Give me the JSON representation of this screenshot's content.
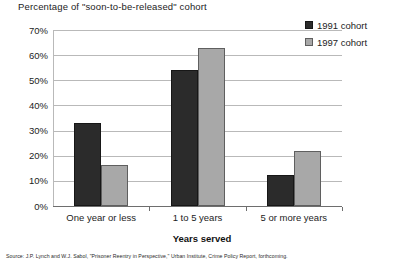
{
  "chart_data": {
    "type": "bar",
    "title": "Percentage of \"soon-to-be-released\" cohort",
    "xlabel": "Years served",
    "ylabel": "",
    "categories": [
      "One year or less",
      "1 to 5 years",
      "5 or more years"
    ],
    "series": [
      {
        "name": "1991 cohort",
        "color": "#2b2b2b",
        "values": [
          33,
          54,
          12.5
        ]
      },
      {
        "name": "1997 cohort",
        "color": "#a8a8a8",
        "values": [
          16.5,
          63,
          22
        ]
      }
    ],
    "ylim": [
      0,
      70
    ],
    "ytick_step": 10,
    "ytick_labels": [
      "70%",
      "60%",
      "50%",
      "40%",
      "30%",
      "20%",
      "10%",
      "0%"
    ],
    "grid": "horizontal",
    "legend_position": "top-right"
  },
  "footer": {
    "source": "Source: J.P. Lynch and W.J. Sabol, \"Prisoner Reentry in Perspective,\" Urban Institute, Crime Policy Report, forthcoming."
  }
}
